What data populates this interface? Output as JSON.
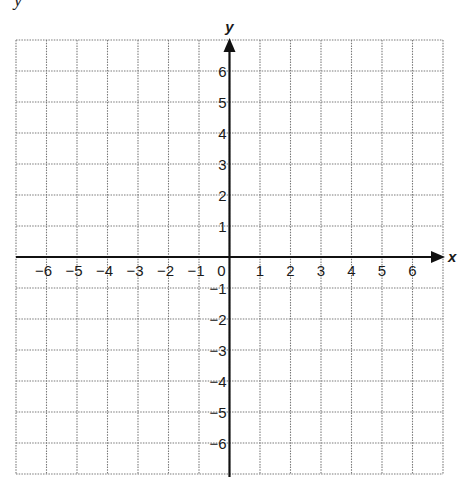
{
  "header": {
    "cut_text": "y"
  },
  "chart_data": {
    "type": "coordinate-grid",
    "title": "",
    "xlabel": "x",
    "ylabel": "y",
    "xlim": [
      -7,
      7
    ],
    "ylim": [
      -7,
      7
    ],
    "x_ticks": [
      -6,
      -5,
      -4,
      -3,
      -2,
      -1,
      0,
      1,
      2,
      3,
      4,
      5,
      6
    ],
    "y_ticks": [
      6,
      5,
      4,
      3,
      2,
      1,
      -1,
      -2,
      -3,
      -4,
      -5,
      -6
    ],
    "x_tick_labels": [
      "−6",
      "−5",
      "−4",
      "−3",
      "−2",
      "−1",
      "0",
      "1",
      "2",
      "3",
      "4",
      "5",
      "6"
    ],
    "y_tick_labels": [
      "6",
      "5",
      "4",
      "3",
      "2",
      "1",
      "−1",
      "−2",
      "−3",
      "−4",
      "−5",
      "−6"
    ],
    "grid": true,
    "grid_style": "dotted",
    "series": [],
    "x_axis_arrow": "positive",
    "y_axis_arrow": "positive"
  },
  "colors": {
    "axis": "#111111",
    "grid": "#7a7a7a",
    "text": "#1a1a1a"
  }
}
